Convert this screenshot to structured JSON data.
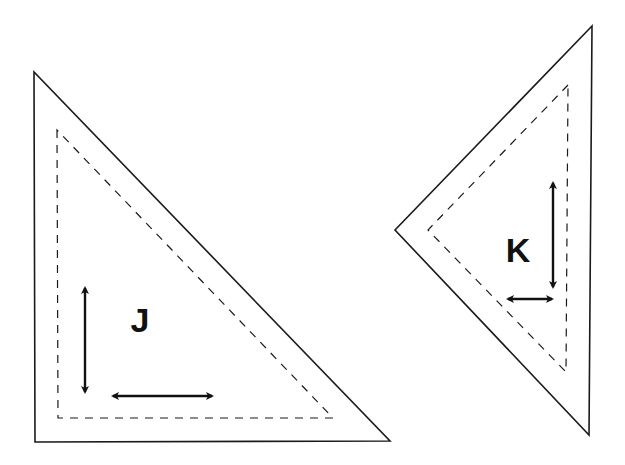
{
  "diagram": {
    "background": "#ffffff",
    "stroke_color": "#1a1a1a",
    "shapes": [
      {
        "id": "J",
        "label": "J",
        "label_position": [
          140,
          320
        ],
        "outer_triangle": [
          [
            34,
            72
          ],
          [
            35,
            442
          ],
          [
            390,
            441
          ]
        ],
        "inner_dashed_triangle": [
          [
            57,
            130
          ],
          [
            58,
            418
          ],
          [
            333,
            418
          ]
        ],
        "arrows": [
          {
            "orientation": "vertical",
            "from": [
              85,
              285
            ],
            "to": [
              85,
              395
            ]
          },
          {
            "orientation": "horizontal",
            "from": [
              110,
              396
            ],
            "to": [
              215,
              396
            ]
          }
        ]
      },
      {
        "id": "K",
        "label": "K",
        "label_position": [
          518,
          250
        ],
        "outer_triangle": [
          [
            592,
            26
          ],
          [
            395,
            230
          ],
          [
            589,
            435
          ]
        ],
        "inner_dashed_triangle": [
          [
            568,
            85
          ],
          [
            428,
            230
          ],
          [
            566,
            372
          ]
        ],
        "arrows": [
          {
            "orientation": "vertical",
            "from": [
              553,
              180
            ],
            "to": [
              553,
              290
            ]
          },
          {
            "orientation": "horizontal",
            "from": [
              505,
              299
            ],
            "to": [
              555,
              299
            ]
          }
        ]
      }
    ]
  }
}
